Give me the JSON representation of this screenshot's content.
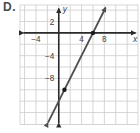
{
  "option_label": "D.",
  "chart_data": {
    "type": "line",
    "title": "",
    "xlabel": "x",
    "ylabel": "y",
    "grid": true,
    "grid_step": 2,
    "xlim": [
      -6.8,
      13.9
    ],
    "ylim": [
      -16.1,
      4.9
    ],
    "x_ticks": [
      {
        "value": -4,
        "label": "−4"
      },
      {
        "value": 4,
        "label": "4"
      },
      {
        "value": 8,
        "label": "8"
      }
    ],
    "y_ticks": [
      {
        "value": 2,
        "label": "2"
      },
      {
        "value": -4,
        "label": "−4"
      },
      {
        "value": -8,
        "label": "−8"
      }
    ],
    "series": [
      {
        "name": "graphed-line",
        "slope": 2,
        "y_intercept": -12,
        "points_marked": [
          [
            6,
            0
          ],
          [
            1,
            -10
          ]
        ]
      }
    ],
    "colors": {
      "background": "#ffffff",
      "grid": "#cccccc",
      "axis": "#2b2b2b",
      "line": "#4f4f4f",
      "point": "#1a1a1a",
      "tick_label": "#3d3d3d",
      "axis_label": "#3d3d3d"
    }
  }
}
